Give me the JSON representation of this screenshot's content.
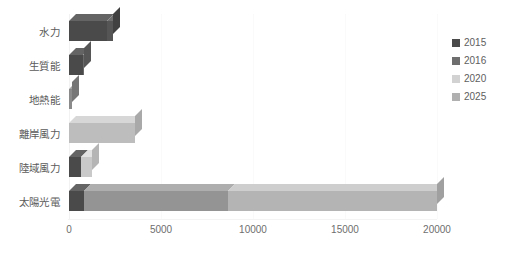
{
  "chart_data": {
    "type": "bar",
    "orientation": "horizontal",
    "stacked": true,
    "title": "",
    "xlabel": "",
    "ylabel": "",
    "xlim": [
      0,
      20000
    ],
    "xticks": [
      "0",
      "5000",
      "10000",
      "15000",
      "20000"
    ],
    "xtick_values": [
      0,
      5000,
      10000,
      15000,
      20000
    ],
    "grid": true,
    "legend_position": "right",
    "categories": [
      "水力",
      "生質能",
      "地熱能",
      "離岸風力",
      "陸域風力",
      "太陽光電"
    ],
    "series": [
      {
        "name": "2015",
        "color": "#4a4a4a",
        "values": [
          2089,
          741,
          0,
          0,
          647,
          842
        ]
      },
      {
        "name": "2016",
        "color": "#6e6e6e",
        "values": [
          0,
          0,
          150,
          0,
          0,
          0
        ]
      },
      {
        "name": "2020",
        "color": "#c9c9c9",
        "values": [
          0,
          0,
          0,
          0,
          213,
          0
        ]
      },
      {
        "name": "2025",
        "color": "#a8a8a8",
        "values": [
          300,
          72,
          0,
          3600,
          0,
          19158
        ]
      }
    ],
    "bars": [
      {
        "category": "水力",
        "segments": [
          {
            "series": "2015",
            "value": 2089,
            "color": "#4a4a4a"
          },
          {
            "series": "2025",
            "value": 300,
            "color": "#555555"
          }
        ],
        "total": 2389
      },
      {
        "category": "生質能",
        "segments": [
          {
            "series": "2015",
            "value": 741,
            "color": "#4a4a4a"
          },
          {
            "series": "2025",
            "value": 72,
            "color": "#6a6a6a"
          }
        ],
        "total": 813
      },
      {
        "category": "地熱能",
        "segments": [
          {
            "series": "2016",
            "value": 150,
            "color": "#8a8a8a"
          }
        ],
        "total": 150
      },
      {
        "category": "離岸風力",
        "segments": [
          {
            "series": "2025",
            "value": 3600,
            "color": "#bdbdbd"
          }
        ],
        "total": 3600
      },
      {
        "category": "陸域風力",
        "segments": [
          {
            "series": "2015",
            "value": 647,
            "color": "#4a4a4a"
          },
          {
            "series": "2020",
            "value": 613,
            "color": "#c9c9c9"
          }
        ],
        "total": 1260
      },
      {
        "category": "太陽光電",
        "segments": [
          {
            "series": "2015",
            "value": 842,
            "color": "#4a4a4a"
          },
          {
            "series": "2020",
            "value": 7800,
            "color": "#949494"
          },
          {
            "series": "2025",
            "value": 11358,
            "color": "#b4b4b4"
          }
        ],
        "total": 20000
      }
    ]
  },
  "legend": {
    "items": [
      {
        "label": "2015",
        "color": "#4a4a4a"
      },
      {
        "label": "2016",
        "color": "#6e6e6e"
      },
      {
        "label": "2020",
        "color": "#d2d2d2"
      },
      {
        "label": "2025",
        "color": "#b0b0b0"
      }
    ]
  }
}
